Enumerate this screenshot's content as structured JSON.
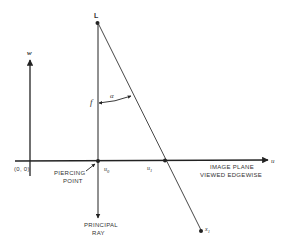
{
  "diagram": {
    "colors": {
      "ink": "#222222",
      "background": "#ffffff"
    },
    "labels": {
      "lens_point": "L",
      "w_axis": "w",
      "u_axis": "u",
      "origin": "(0, 0)",
      "piercing_point_line1": "PIERCING",
      "piercing_point_line2": "POINT",
      "u0": "u",
      "u0_sub": "0",
      "u1": "u",
      "u1_sub": "1",
      "x1": "x",
      "x1_sub": "1",
      "focal_length": "f",
      "angle": "α",
      "image_plane_line1": "IMAGE PLANE",
      "image_plane_line2": "VIEWED EDGEWISE",
      "principal_ray_line1": "PRINCIPAL",
      "principal_ray_line2": "RAY"
    }
  }
}
